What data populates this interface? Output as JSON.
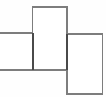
{
  "figure": {
    "canvas": {
      "width": 106,
      "height": 97,
      "background_color": "#fefefe"
    },
    "style": {
      "stroke_color": "#7d7d7d",
      "stroke_color_dark": "#4a4a4a",
      "stroke_width": 1.6,
      "fill_color": "#ffffff"
    },
    "shapes": [
      {
        "name": "left-rectangle",
        "label": "",
        "x": -8,
        "y": 33,
        "width": 41,
        "height": 37,
        "clipped_edge": "left"
      },
      {
        "name": "middle-rectangle",
        "label": "",
        "x": 32.5,
        "y": 7,
        "width": 34.5,
        "height": 63,
        "clipped_edge": "none"
      },
      {
        "name": "right-rectangle",
        "label": "",
        "x": 67,
        "y": 34,
        "width": 35.5,
        "height": 60,
        "clipped_edge": "none"
      }
    ],
    "seams": [
      {
        "name": "left-middle-seam",
        "x": 33,
        "y1": 33,
        "y2": 70
      },
      {
        "name": "middle-right-seam",
        "x": 67,
        "y1": 34,
        "y2": 70
      }
    ]
  }
}
